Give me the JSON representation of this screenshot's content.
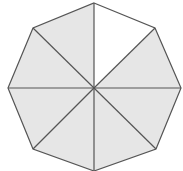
{
  "diagram": {
    "shape": "regular-octagon",
    "center": [
      94,
      88
    ],
    "vertices": [
      [
        94,
        3
      ],
      [
        155,
        28
      ],
      [
        181,
        88
      ],
      [
        156,
        149
      ],
      [
        94,
        171
      ],
      [
        33,
        149
      ],
      [
        8,
        88
      ],
      [
        33,
        28
      ]
    ],
    "sectors_total": 8,
    "sectors_shaded": 7,
    "unshaded_sector_index": 0,
    "colors": {
      "shaded_fill": "#e6e6e6",
      "unshaded_fill": "#ffffff",
      "stroke": "#555555",
      "background": "#ffffff"
    },
    "stroke_width": 1.2
  }
}
